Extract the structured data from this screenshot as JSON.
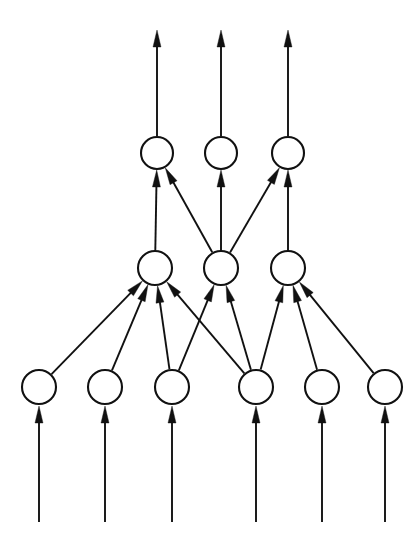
{
  "figure": {
    "kind": "node-link-diagram",
    "background_color": "#ffffff",
    "ink_color": "#111111",
    "canvas": {
      "width": 420,
      "height": 542
    }
  },
  "style": {
    "node_fill": "#ffffff",
    "node_stroke": "#111111",
    "node_stroke_width": 2.1,
    "edge_stroke": "#111111",
    "edge_stroke_width": 1.9,
    "arrow_fill": "#111111",
    "arrow_length": 17,
    "arrow_half_width": 4.0
  },
  "layers": [
    {
      "id": "output-layer",
      "name": "top-layer",
      "row_y": 153,
      "radius": 16,
      "nodes": [
        {
          "id": "t1",
          "label": "",
          "cx": 157,
          "cy": 153,
          "r": 16
        },
        {
          "id": "t2",
          "label": "",
          "cx": 221,
          "cy": 153,
          "r": 16
        },
        {
          "id": "t3",
          "label": "",
          "cx": 288,
          "cy": 153,
          "r": 16
        }
      ]
    },
    {
      "id": "hidden-layer",
      "name": "middle-layer",
      "row_y": 268,
      "radius": 17,
      "nodes": [
        {
          "id": "m1",
          "label": "",
          "cx": 155,
          "cy": 268,
          "r": 17
        },
        {
          "id": "m2",
          "label": "",
          "cx": 221,
          "cy": 268,
          "r": 17
        },
        {
          "id": "m3",
          "label": "",
          "cx": 288,
          "cy": 268,
          "r": 17
        }
      ]
    },
    {
      "id": "input-layer",
      "name": "bottom-layer",
      "row_y": 387,
      "radius": 17,
      "nodes": [
        {
          "id": "b1",
          "label": "",
          "cx": 39,
          "cy": 387,
          "r": 17
        },
        {
          "id": "b2",
          "label": "",
          "cx": 105,
          "cy": 387,
          "r": 17
        },
        {
          "id": "b3",
          "label": "",
          "cx": 172,
          "cy": 387,
          "r": 17
        },
        {
          "id": "b4",
          "label": "",
          "cx": 256,
          "cy": 387,
          "r": 17
        },
        {
          "id": "b5",
          "label": "",
          "cx": 322,
          "cy": 387,
          "r": 17
        },
        {
          "id": "b6",
          "label": "",
          "cx": 385,
          "cy": 387,
          "r": 17
        }
      ]
    }
  ],
  "edges": [
    {
      "id": "e-b1-m1",
      "from": "b1",
      "to": "m1",
      "arrow": true
    },
    {
      "id": "e-b2-m1",
      "from": "b2",
      "to": "m1",
      "arrow": true
    },
    {
      "id": "e-b3-m1",
      "from": "b3",
      "to": "m1",
      "arrow": true
    },
    {
      "id": "e-b3-m2",
      "from": "b3",
      "to": "m2",
      "arrow": true
    },
    {
      "id": "e-b4-m1",
      "from": "b4",
      "to": "m1",
      "arrow": true
    },
    {
      "id": "e-b4-m2",
      "from": "b4",
      "to": "m2",
      "arrow": true
    },
    {
      "id": "e-b4-m3",
      "from": "b4",
      "to": "m3",
      "arrow": true
    },
    {
      "id": "e-b5-m3",
      "from": "b5",
      "to": "m3",
      "arrow": true
    },
    {
      "id": "e-b6-m3",
      "from": "b6",
      "to": "m3",
      "arrow": true
    },
    {
      "id": "e-m1-t1",
      "from": "m1",
      "to": "t1",
      "arrow": true
    },
    {
      "id": "e-m2-t1",
      "from": "m2",
      "to": "t1",
      "arrow": true
    },
    {
      "id": "e-m2-t2",
      "from": "m2",
      "to": "t2",
      "arrow": true
    },
    {
      "id": "e-m2-t3",
      "from": "m2",
      "to": "t3",
      "arrow": true
    },
    {
      "id": "e-m3-t3",
      "from": "m3",
      "to": "t3",
      "arrow": true
    }
  ],
  "input_arrows": [
    {
      "id": "in1",
      "to": "b1",
      "x": 39,
      "y_start": 522,
      "y_end": 406
    },
    {
      "id": "in2",
      "to": "b2",
      "x": 105,
      "y_start": 522,
      "y_end": 406
    },
    {
      "id": "in3",
      "to": "b3",
      "x": 172,
      "y_start": 522,
      "y_end": 406
    },
    {
      "id": "in4",
      "to": "b4",
      "x": 256,
      "y_start": 522,
      "y_end": 406
    },
    {
      "id": "in5",
      "to": "b5",
      "x": 322,
      "y_start": 522,
      "y_end": 406
    },
    {
      "id": "in6",
      "to": "b6",
      "x": 385,
      "y_start": 522,
      "y_end": 406
    }
  ],
  "output_arrows": [
    {
      "id": "out1",
      "from": "t1",
      "x": 157,
      "y_start": 136,
      "y_end": 30
    },
    {
      "id": "out2",
      "from": "t2",
      "x": 221,
      "y_start": 136,
      "y_end": 30
    },
    {
      "id": "out3",
      "from": "t3",
      "x": 288,
      "y_start": 136,
      "y_end": 30
    }
  ]
}
